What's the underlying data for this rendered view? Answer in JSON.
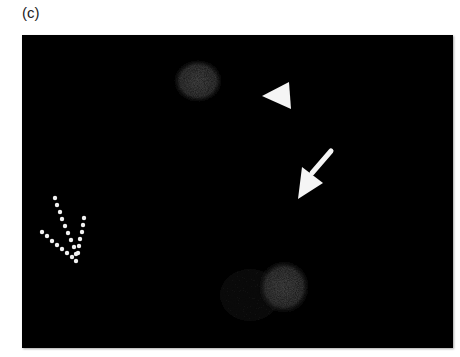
{
  "figure": {
    "panel_label": "(c)",
    "background_color": "#000000",
    "annotations": [
      {
        "type": "arrowhead",
        "name": "triangle-marker",
        "color": "#ffffff"
      },
      {
        "type": "arrow",
        "name": "solid-arrow",
        "color": "#ffffff"
      },
      {
        "type": "dotted-arrow",
        "name": "dotted-arrow",
        "color": "#ffffff"
      }
    ],
    "features": [
      {
        "name": "upper-blob",
        "color": "#3a3a3a"
      },
      {
        "name": "lower-blob",
        "color": "#3a3a3a"
      }
    ]
  }
}
